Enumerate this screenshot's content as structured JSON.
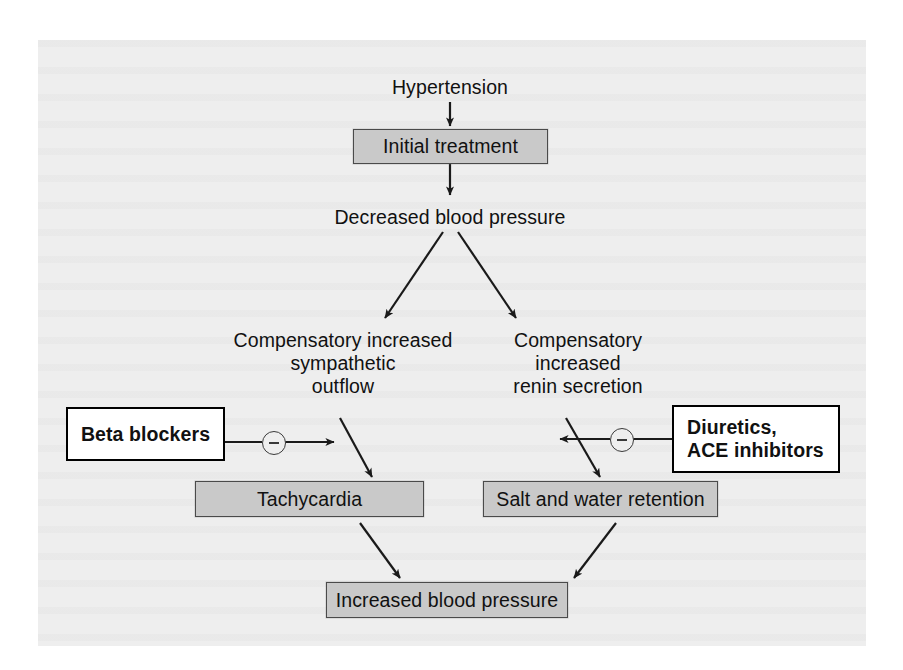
{
  "diagram": {
    "colors": {
      "background": "#eeeeee",
      "gray_box_fill": "#c9c9c9",
      "gray_box_border": "#4a4a4a",
      "drug_box_fill": "#ffffff",
      "drug_box_border": "#000000",
      "line": "#1a1a1a",
      "text": "#111111"
    },
    "nodes": {
      "hypertension": "Hypertension",
      "initial_treatment": "Initial treatment",
      "decreased_bp": "Decreased blood pressure",
      "sympathetic": "Compensatory increased\nsympathetic\noutflow",
      "renin": "Compensatory\nincreased\nrenin secretion",
      "beta_blockers": "Beta blockers",
      "diuretics": "Diuretics,\n   ACE inhibitors",
      "tachycardia": "Tachycardia",
      "salt_water": "Salt and water retention",
      "increased_bp": "Increased blood pressure"
    },
    "signs": {
      "left_inhibition": "minus-sign",
      "right_inhibition": "minus-sign"
    },
    "edges": [
      {
        "from": "hypertension",
        "to": "initial_treatment",
        "type": "arrow"
      },
      {
        "from": "initial_treatment",
        "to": "decreased_bp",
        "type": "arrow"
      },
      {
        "from": "decreased_bp",
        "to": "sympathetic",
        "type": "arrow"
      },
      {
        "from": "decreased_bp",
        "to": "renin",
        "type": "arrow"
      },
      {
        "from": "sympathetic",
        "to": "tachycardia",
        "type": "arrow"
      },
      {
        "from": "renin",
        "to": "salt_water",
        "type": "arrow"
      },
      {
        "from": "beta_blockers",
        "to": "sympathetic-to-tachycardia",
        "type": "inhibition"
      },
      {
        "from": "diuretics",
        "to": "renin-to-salt_water",
        "type": "inhibition"
      },
      {
        "from": "tachycardia",
        "to": "increased_bp",
        "type": "arrow"
      },
      {
        "from": "salt_water",
        "to": "increased_bp",
        "type": "arrow"
      }
    ]
  }
}
